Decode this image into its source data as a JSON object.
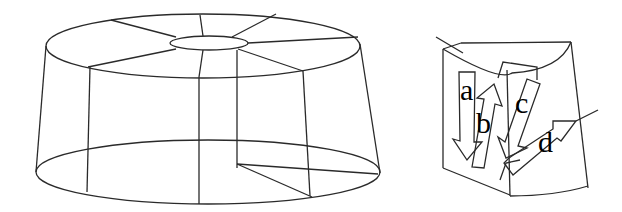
{
  "figure": {
    "left_panel": {
      "description": "Wireframe truncated cone (annular cylinder) with central hole, radial segment lines on top face and one highlighted wedge-shaped sector",
      "shape": "annular-truncated-cone"
    },
    "right_panel": {
      "description": "Enlarged single wedge sector with flow arrows labeled a–d",
      "labels": [
        {
          "id": "a",
          "text": "a",
          "arrow_direction": "down"
        },
        {
          "id": "b",
          "text": "b",
          "arrow_direction": "up"
        },
        {
          "id": "c",
          "text": "c",
          "arrow_direction": "down-left"
        },
        {
          "id": "d",
          "text": "d",
          "arrow_direction": "up-right"
        }
      ]
    },
    "colors": {
      "background": "#ffffff",
      "stroke": "#2a2a2a",
      "label": "#000000"
    }
  }
}
